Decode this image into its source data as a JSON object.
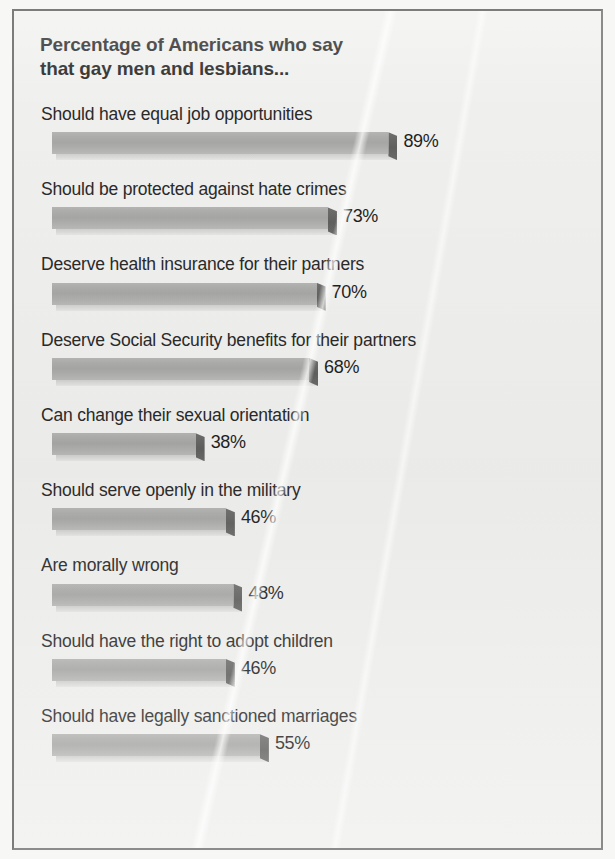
{
  "chart_data": {
    "type": "bar",
    "title": "Percentage of Americans who say\nthat gay men and lesbians...",
    "xlabel": "",
    "ylabel": "",
    "orientation": "horizontal",
    "value_suffix": "%",
    "xlim": [
      0,
      100
    ],
    "grid": false,
    "legend": "none",
    "categories": [
      "Should have equal job opportunities",
      "Should be protected against hate crimes",
      "Deserve health insurance for their partners",
      "Deserve Social Security benefits for their partners",
      "Can change their sexual orientation",
      "Should serve openly in the military",
      "Are morally wrong",
      "Should have the right to adopt children",
      "Should have legally sanctioned marriages"
    ],
    "values": [
      89,
      73,
      70,
      68,
      38,
      46,
      48,
      46,
      55
    ],
    "value_labels": [
      "89%",
      "73%",
      "70%",
      "68%",
      "38%",
      "46%",
      "48%",
      "46%",
      "55%"
    ],
    "bar_color": "#a9a9a7",
    "bar_cap_color": "#5f5f5d",
    "bar_base_color": "#d8d8d6",
    "text_color": "#2a2a2a",
    "background_color": "#efefed",
    "frame_color": "#8b8b8b"
  }
}
